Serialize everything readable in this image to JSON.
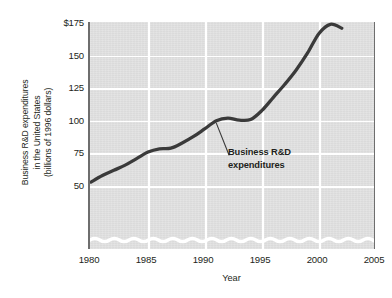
{
  "chart_data": {
    "type": "line",
    "title": "",
    "subtitle": "",
    "xlabel": "Year",
    "ylabel": "Business R&D expenditures in the United States (billions of 1996 dollars)",
    "ylabel_lines": [
      "Business R&D expenditures",
      "in the United States",
      "(billions of 1996 dollars)"
    ],
    "xlim": [
      1980,
      2005
    ],
    "ylim": [
      50,
      175
    ],
    "y_axis_break": true,
    "grid": true,
    "legend": "none",
    "xticks": [
      "1980",
      "1985",
      "1990",
      "1995",
      "2000",
      "2005"
    ],
    "xtick_values": [
      1980,
      1985,
      1990,
      1995,
      2000,
      2005
    ],
    "yticks": [
      "50",
      "75",
      "100",
      "125",
      "150",
      "$175"
    ],
    "ytick_values": [
      50,
      75,
      100,
      125,
      150,
      175
    ],
    "series": [
      {
        "name": "Business R&D expenditures",
        "color": "#3a3a3a",
        "x": [
          1980,
          1981,
          1982,
          1983,
          1984,
          1985,
          1986,
          1987,
          1988,
          1989,
          1990,
          1991,
          1992,
          1993,
          1994,
          1995,
          1996,
          1997,
          1998,
          1999,
          2000,
          2001,
          2002
        ],
        "values": [
          53,
          58,
          62,
          66,
          71,
          76,
          78.5,
          79,
          83,
          88,
          94,
          100,
          102,
          100.5,
          101,
          108,
          118,
          128,
          139,
          152,
          167,
          174,
          171
        ]
      }
    ],
    "annotations": [
      {
        "text_lines": [
          "Business R&D",
          "expenditures"
        ],
        "text": "Business R&D expenditures",
        "points_to_year": 1991,
        "points_to_value": 98
      }
    ]
  },
  "axes": {
    "x_title": "Year"
  }
}
